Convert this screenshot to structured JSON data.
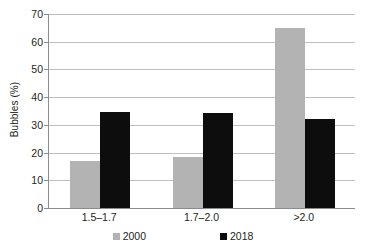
{
  "chart_data": {
    "type": "bar",
    "title": "",
    "xlabel": "",
    "ylabel": "Bubbles (%)",
    "ylim": [
      0,
      70
    ],
    "ytick_step": 10,
    "yticks": [
      "0",
      "10",
      "20",
      "30",
      "40",
      "50",
      "60",
      "70"
    ],
    "grid": true,
    "legend_position": "bottom-center",
    "categories": [
      "1.5–1.7",
      "1.7–2.0",
      ">2.0"
    ],
    "series": [
      {
        "name": "2000",
        "color": "#b3b3b3",
        "values": [
          17,
          18.4,
          65
        ]
      },
      {
        "name": "2018",
        "color": "#0d0d0d",
        "values": [
          34.6,
          34.3,
          32
        ]
      }
    ]
  },
  "axis": {
    "y_title": "Bubbles (%)"
  },
  "legend": {
    "items": [
      {
        "label": "2000"
      },
      {
        "label": "2018"
      }
    ]
  }
}
